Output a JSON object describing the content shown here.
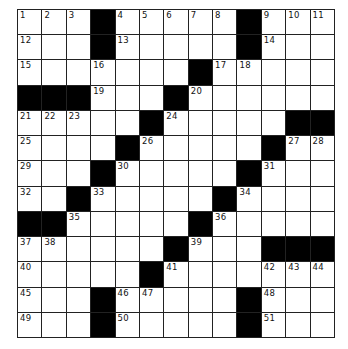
{
  "puzzle": {
    "rows": 13,
    "cols": 13,
    "colors": {
      "block": "#000000",
      "cell": "#ffffff",
      "line": "#222222"
    },
    "grid": [
      [
        "1",
        "2",
        "3",
        "#",
        "4",
        "5",
        "6",
        "7",
        "8",
        "#",
        "9",
        "10",
        "11"
      ],
      [
        "12",
        "",
        "",
        "#",
        "13",
        "",
        "",
        "",
        "",
        "#",
        "14",
        "",
        ""
      ],
      [
        "15",
        "",
        "",
        "16",
        "",
        "",
        "",
        "#",
        "17",
        "18",
        "",
        "",
        ""
      ],
      [
        "#",
        "#",
        "#",
        "19",
        "",
        "",
        "#",
        "20",
        "",
        "",
        "",
        "",
        ""
      ],
      [
        "21",
        "22",
        "23",
        "",
        "",
        "#",
        "24",
        "",
        "",
        "",
        "",
        "#",
        "#"
      ],
      [
        "25",
        "",
        "",
        "",
        "#",
        "26",
        "",
        "",
        "",
        "",
        "#",
        "27",
        "28"
      ],
      [
        "29",
        "",
        "",
        "#",
        "30",
        "",
        "",
        "",
        "",
        "#",
        "31",
        "",
        ""
      ],
      [
        "32",
        "",
        "#",
        "33",
        "",
        "",
        "",
        "",
        "#",
        "34",
        "",
        "",
        ""
      ],
      [
        "#",
        "#",
        "35",
        "",
        "",
        "",
        "",
        "#",
        "36",
        "",
        "",
        "",
        ""
      ],
      [
        "37",
        "38",
        "",
        "",
        "",
        "",
        "#",
        "39",
        "",
        "",
        "#",
        "#",
        "#"
      ],
      [
        "40",
        "",
        "",
        "",
        "",
        "#",
        "41",
        "",
        "",
        "",
        "42",
        "43",
        "44"
      ],
      [
        "45",
        "",
        "",
        "#",
        "46",
        "47",
        "",
        "",
        "",
        "#",
        "48",
        "",
        ""
      ],
      [
        "49",
        "",
        "",
        "#",
        "50",
        "",
        "",
        "",
        "",
        "#",
        "51",
        "",
        ""
      ]
    ]
  }
}
